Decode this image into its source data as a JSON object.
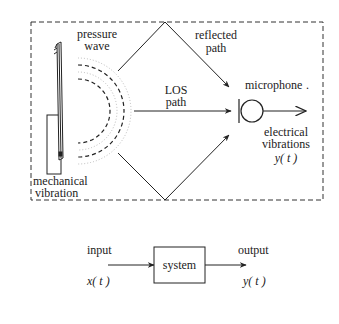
{
  "top_diagram": {
    "labels": {
      "pressure_wave_1": "pressure",
      "pressure_wave_2": "wave",
      "reflected_path_1": "reflected",
      "reflected_path_2": "path",
      "los_path_1": "LOS",
      "los_path_2": "path",
      "microphone": "microphone",
      "microphone_dot": ".",
      "electrical_1": "electrical",
      "electrical_2": "vibrations",
      "output_signal": "y( t )",
      "mechanical_1": "mechanical",
      "mechanical_2": "vibration"
    }
  },
  "bottom_diagram": {
    "input_label": "input",
    "input_signal": "x( t )",
    "system_label": "system",
    "output_label": "output",
    "output_signal": "y( t )"
  },
  "colors": {
    "stroke": "#222222",
    "wave_light": "#b8b8b8"
  }
}
